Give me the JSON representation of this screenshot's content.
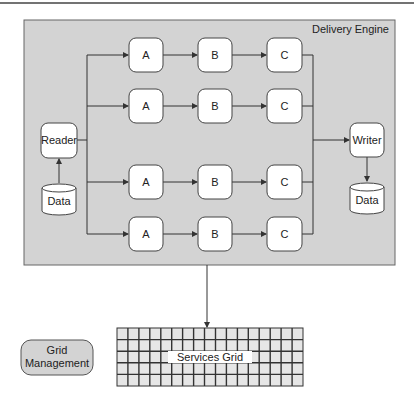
{
  "container": {
    "title": "Delivery Engine",
    "fill": "#d3d3d3",
    "stroke": "#555555"
  },
  "reader": {
    "label": "Reader"
  },
  "reader_source": {
    "label": "Data"
  },
  "writer": {
    "label": "Writer"
  },
  "writer_sink": {
    "label": "Data"
  },
  "pipelines": [
    {
      "stages": [
        "A",
        "B",
        "C"
      ]
    },
    {
      "stages": [
        "A",
        "B",
        "C"
      ]
    },
    {
      "stages": [
        "A",
        "B",
        "C"
      ]
    },
    {
      "stages": [
        "A",
        "B",
        "C"
      ]
    }
  ],
  "services_grid": {
    "label": "Services Grid"
  },
  "grid_management": {
    "line1": "Grid",
    "line2": "Management",
    "fill": "#d3d3d3"
  }
}
